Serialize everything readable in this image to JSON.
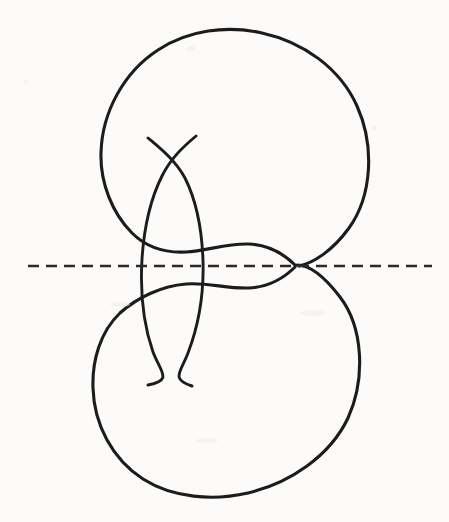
{
  "figure": {
    "background_color": "#fcfbfa",
    "ink_color": "#1c1c1c",
    "axis_color": "#2a2a2a",
    "width": 449,
    "height": 522,
    "stroke_width": 3.1,
    "axis_dash_pattern": "11 7"
  },
  "geometry": {
    "axis": {
      "label": "horizontal-dashed-axis",
      "y": 266,
      "x_start": 28,
      "x_end": 432
    },
    "main_curve": {
      "label": "figure-eight-curve",
      "self_intersection": {
        "x": 295,
        "y": 266
      },
      "upper_loop": {
        "top": {
          "x": 232,
          "y": 32
        },
        "left": {
          "x": 100,
          "y": 122
        },
        "right": {
          "x": 368,
          "y": 170
        }
      },
      "lower_loop": {
        "bottom": {
          "x": 212,
          "y": 495
        },
        "left": {
          "x": 92,
          "y": 408
        },
        "right": {
          "x": 362,
          "y": 372
        }
      },
      "path": "M 295 266 C 280 252 262 243 240 243 C 205 243 175 255 150 240 C 110 216 96 172 100 140 C 105 92 145 48 200 35 C 262 20 330 50 356 100 C 382 150 372 205 340 240 C 318 264 300 270 295 266 Z M 295 266 C 280 280 262 289 240 289 C 205 289 172 280 145 297 C 105 322 90 370 95 410 C 101 455 140 492 195 497 C 258 503 325 470 350 420 C 374 372 366 318 336 290 C 316 271 300 262 295 266 Z"
    },
    "inner_lens": {
      "label": "vertical-lens",
      "left_arc_extreme": {
        "x": 141,
        "y": 266
      },
      "right_arc_extreme": {
        "x": 202,
        "y": 266
      },
      "top_crossing": {
        "x": 170,
        "y": 168
      },
      "bottom_crossing": {
        "x": 168,
        "y": 357
      },
      "top_left_tip": {
        "x": 148,
        "y": 138
      },
      "top_right_tip": {
        "x": 196,
        "y": 136
      },
      "bottom_left_tip": {
        "x": 148,
        "y": 385
      },
      "bottom_right_tip": {
        "x": 192,
        "y": 386
      }
    }
  },
  "annotations": {
    "stroke_count": 3,
    "element_names": [
      "figure-eight-curve",
      "vertical-lens-left-arc",
      "vertical-lens-right-arc",
      "horizontal-dashed-axis"
    ]
  }
}
